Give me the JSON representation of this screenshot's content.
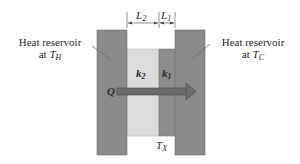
{
  "diagram": {
    "left_reservoir": {
      "label_line1": "Heat reservoir",
      "label_line2_prefix": "at ",
      "temp_symbol": "T",
      "temp_sub": "H",
      "color": "#8a8a8a"
    },
    "right_reservoir": {
      "label_line1": "Heat reservoir",
      "label_line2_prefix": "at ",
      "temp_symbol": "T",
      "temp_sub": "C",
      "color": "#8a8a8a"
    },
    "slab2": {
      "conductivity_symbol": "k",
      "conductivity_sub": "2",
      "thickness_symbol": "L",
      "thickness_sub": "2",
      "color": "#dcdcdc"
    },
    "slab1": {
      "conductivity_symbol": "k",
      "conductivity_sub": "1",
      "thickness_symbol": "L",
      "thickness_sub": "1",
      "color": "#8c8c8c"
    },
    "interface_temp": {
      "symbol": "T",
      "sub": "X"
    },
    "heat_flow": {
      "symbol": "Q",
      "direction": "right"
    }
  }
}
